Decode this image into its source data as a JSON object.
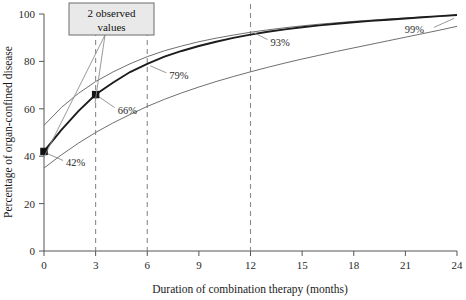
{
  "chart_data": {
    "type": "line",
    "title": "",
    "xlabel": "Duration of combination therapy (months)",
    "ylabel": "Percentage of organ-confined disease",
    "xlim": [
      0,
      24
    ],
    "ylim": [
      0,
      100
    ],
    "xticks": [
      0,
      3,
      6,
      9,
      12,
      15,
      18,
      21,
      24
    ],
    "yticks": [
      0,
      20,
      40,
      60,
      80,
      100
    ],
    "grid": false,
    "legend": "none",
    "x": [
      0,
      1,
      2,
      3,
      4,
      5,
      6,
      7,
      8,
      9,
      10,
      11,
      12,
      13,
      14,
      15,
      16,
      17,
      18,
      19,
      20,
      21,
      22,
      23,
      24
    ],
    "series": [
      {
        "name": "Upper 95% confidence limit",
        "style": "thin",
        "values": [
          53,
          60.5,
          66.5,
          71.5,
          75.5,
          79,
          82,
          84.5,
          86.5,
          88.3,
          89.8,
          91.1,
          92.3,
          93.3,
          94.2,
          95.0,
          95.7,
          96.3,
          96.9,
          97.4,
          97.9,
          98.3,
          98.7,
          99.1,
          99.5
        ]
      },
      {
        "name": "Predicted percentage organ-confined",
        "style": "thick",
        "values": [
          42,
          51,
          59,
          66,
          71,
          75.5,
          79,
          82,
          84.4,
          86.5,
          88.3,
          89.9,
          91.3,
          92.5,
          93.5,
          94.4,
          95.2,
          95.9,
          96.5,
          97.1,
          97.6,
          98.1,
          98.6,
          99.1,
          99.6
        ]
      },
      {
        "name": "Lower 95% confidence limit",
        "style": "thin",
        "values": [
          35,
          40.5,
          45.5,
          50,
          54,
          57.6,
          61,
          64,
          66.7,
          69.2,
          71.5,
          73.6,
          75.6,
          77.5,
          79.3,
          81.0,
          82.6,
          84.2,
          85.7,
          87.2,
          88.7,
          90.2,
          91.7,
          93.2,
          94.8
        ]
      }
    ],
    "reference_lines": {
      "orientation": "vertical",
      "values": [
        3,
        6,
        12
      ],
      "style": "dashed"
    },
    "observed_points": [
      {
        "x": 0,
        "y": 42,
        "label": "42%"
      },
      {
        "x": 3,
        "y": 66,
        "label": "66%"
      }
    ],
    "point_labels": [
      {
        "x": 0,
        "y": 42,
        "text": "42%"
      },
      {
        "x": 3,
        "y": 66,
        "text": "66%"
      },
      {
        "x": 6,
        "y": 79,
        "text": "79%"
      },
      {
        "x": 12,
        "y": 93,
        "text": "93%"
      },
      {
        "x": 24,
        "y": 99,
        "text": "99%"
      }
    ],
    "annotations": [
      {
        "name": "observed-values-callout",
        "line1": "2 observed",
        "line2": "values",
        "points_to": [
          {
            "x": 0,
            "y": 42
          },
          {
            "x": 3,
            "y": 66
          }
        ]
      }
    ]
  },
  "axes": {
    "x_title": "Duration of combination therapy (months)",
    "y_title": "Percentage of organ-confined disease",
    "x_tick_labels": [
      "0",
      "3",
      "6",
      "9",
      "12",
      "15",
      "18",
      "21",
      "24"
    ],
    "y_tick_labels": [
      "0",
      "20",
      "40",
      "60",
      "80",
      "100"
    ]
  },
  "labels": {
    "pct_42": "42%",
    "pct_66": "66%",
    "pct_79": "79%",
    "pct_93": "93%",
    "pct_99": "99%",
    "callout_line1": "2 observed",
    "callout_line2": "values"
  },
  "colors": {
    "main_curve": "#1c1c1c",
    "band_curve": "#6f6f6f",
    "reference_line": "#8a8a8a",
    "callout_fill": "#e9e9e9",
    "callout_stroke": "#6d6d6d",
    "background": "#ffffff"
  }
}
